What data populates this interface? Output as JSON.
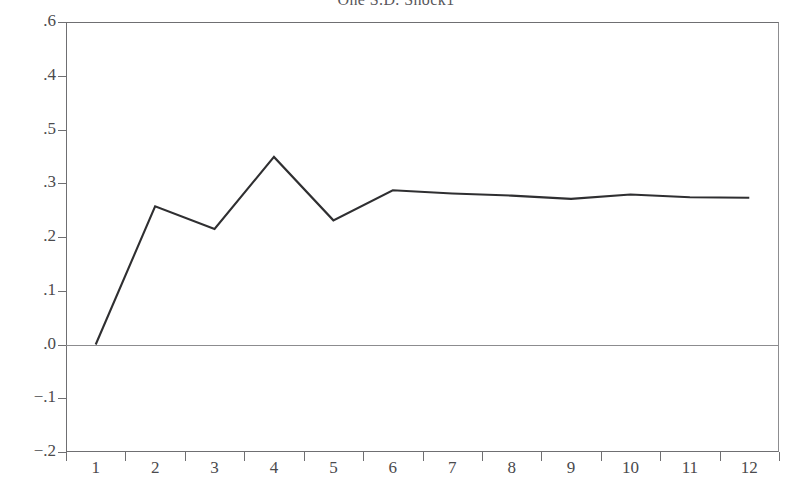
{
  "chart_data": {
    "type": "line",
    "title": "One S.D. Shock1",
    "xlabel": "",
    "ylabel": "",
    "x": [
      1,
      2,
      3,
      4,
      5,
      6,
      7,
      8,
      9,
      10,
      11,
      12
    ],
    "categories": [
      "1",
      "2",
      "3",
      "4",
      "5",
      "6",
      "7",
      "8",
      "9",
      "10",
      "11",
      "12"
    ],
    "series": [
      {
        "name": "Response",
        "values": [
          0.0,
          0.257,
          0.215,
          0.349,
          0.231,
          0.287,
          0.281,
          0.277,
          0.271,
          0.279,
          0.274,
          0.273
        ]
      }
    ],
    "xlim": [
      0.5,
      12.5
    ],
    "ylim": [
      -0.2,
      0.6
    ],
    "y_tick_labels": [
      ".6",
      ".4",
      ".5",
      ".3",
      ".2",
      ".1",
      ".0",
      "−.1",
      "−.2"
    ],
    "y_tick_values": [
      0.6,
      0.5,
      0.4,
      0.3,
      0.2,
      0.1,
      0.0,
      -0.1,
      -0.2
    ],
    "x_tick_labels": [
      "1",
      "2",
      "3",
      "4",
      "5",
      "6",
      "7",
      "8",
      "9",
      "10",
      "11",
      "12"
    ],
    "grid": false,
    "legend": false,
    "zero_line": true,
    "line_color": "#2f2f31",
    "axis_color": "#6f6f72",
    "background": "#ffffff"
  },
  "figure": {
    "title": "One S.D. Shock1"
  }
}
